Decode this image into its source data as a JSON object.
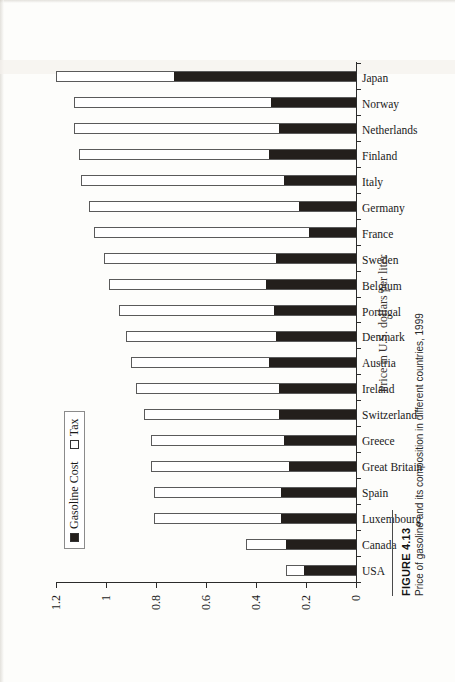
{
  "figure": {
    "number_label": "FIGURE 4.13",
    "caption": "Price of gasoline and its composition in different countries, 1999"
  },
  "legend": {
    "items": [
      {
        "label": "Gasoline Cost",
        "swatch": "black"
      },
      {
        "label": "Tax",
        "swatch": "white"
      }
    ]
  },
  "axis": {
    "value_title": "Price in U.S. dollars per liter",
    "ticks": [
      "0",
      "0.2",
      "0.4",
      "0.6",
      "0.8",
      "1",
      "1.2"
    ]
  },
  "chart_data": {
    "type": "bar",
    "title": "Price of gasoline and its composition in different countries, 1999",
    "xlabel": "",
    "ylabel": "Price in U.S. dollars per liter",
    "ylim": [
      0,
      1.2
    ],
    "grid": false,
    "legend_position": "top-left",
    "stacked": true,
    "categories": [
      "USA",
      "Canada",
      "Luxembourg",
      "Spain",
      "Great Britain",
      "Greece",
      "Switzerland",
      "Ireland",
      "Austria",
      "Denmark",
      "Portugal",
      "Belgium",
      "Sweden",
      "France",
      "Germany",
      "Italy",
      "Finland",
      "Netherlands",
      "Norway",
      "Japan"
    ],
    "series": [
      {
        "name": "Gasoline Cost",
        "values": [
          0.21,
          0.28,
          0.3,
          0.3,
          0.27,
          0.29,
          0.31,
          0.31,
          0.35,
          0.32,
          0.33,
          0.36,
          0.32,
          0.19,
          0.23,
          0.29,
          0.35,
          0.31,
          0.34,
          0.73
        ]
      },
      {
        "name": "Tax",
        "values": [
          0.07,
          0.16,
          0.51,
          0.51,
          0.55,
          0.53,
          0.54,
          0.57,
          0.55,
          0.6,
          0.62,
          0.63,
          0.69,
          0.86,
          0.84,
          0.81,
          0.76,
          0.82,
          0.79,
          0.48
        ]
      }
    ],
    "totals": [
      0.28,
      0.44,
      0.81,
      0.81,
      0.82,
      0.82,
      0.85,
      0.88,
      0.9,
      0.92,
      0.95,
      0.99,
      1.01,
      1.05,
      1.07,
      1.1,
      1.11,
      1.13,
      1.13,
      1.21
    ]
  }
}
